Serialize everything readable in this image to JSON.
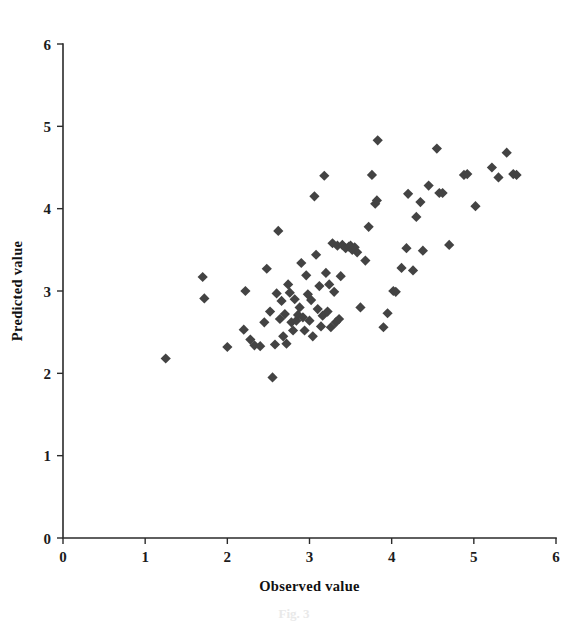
{
  "figure": {
    "background_color": "#ffffff",
    "marker_color": "#434343",
    "axis_color": "#2b2b2b",
    "caption_partial": "Fig. 3"
  },
  "chart_data": {
    "type": "scatter",
    "title": "",
    "xlabel": "Observed value",
    "ylabel": "Predicted value",
    "xlim": [
      0,
      6
    ],
    "ylim": [
      0,
      6
    ],
    "xticks": [
      "0",
      "1",
      "2",
      "3",
      "4",
      "5",
      "6"
    ],
    "yticks": [
      "0",
      "1",
      "2",
      "3",
      "4",
      "5",
      "6"
    ],
    "xtick_values": [
      0,
      1,
      2,
      3,
      4,
      5,
      6
    ],
    "ytick_values": [
      0,
      1,
      2,
      3,
      4,
      5,
      6
    ],
    "grid": false,
    "legend": null,
    "marker": "diamond",
    "marker_size": 9,
    "series": [
      {
        "name": "Observed vs Predicted",
        "color": "#434343",
        "points": [
          [
            1.25,
            2.18
          ],
          [
            1.7,
            3.17
          ],
          [
            1.72,
            2.91
          ],
          [
            2.0,
            2.32
          ],
          [
            2.2,
            2.53
          ],
          [
            2.22,
            3.0
          ],
          [
            2.28,
            2.41
          ],
          [
            2.33,
            2.34
          ],
          [
            2.4,
            2.33
          ],
          [
            2.45,
            2.62
          ],
          [
            2.48,
            3.27
          ],
          [
            2.52,
            2.75
          ],
          [
            2.55,
            1.95
          ],
          [
            2.58,
            2.35
          ],
          [
            2.6,
            2.97
          ],
          [
            2.62,
            3.73
          ],
          [
            2.64,
            2.66
          ],
          [
            2.66,
            2.88
          ],
          [
            2.68,
            2.45
          ],
          [
            2.7,
            2.72
          ],
          [
            2.72,
            2.36
          ],
          [
            2.74,
            3.08
          ],
          [
            2.76,
            2.98
          ],
          [
            2.78,
            2.62
          ],
          [
            2.8,
            2.52
          ],
          [
            2.82,
            2.9
          ],
          [
            2.84,
            2.64
          ],
          [
            2.86,
            2.71
          ],
          [
            2.88,
            2.8
          ],
          [
            2.9,
            3.34
          ],
          [
            2.92,
            2.68
          ],
          [
            2.94,
            2.52
          ],
          [
            2.96,
            3.19
          ],
          [
            2.98,
            2.96
          ],
          [
            3.0,
            2.64
          ],
          [
            3.02,
            2.89
          ],
          [
            3.04,
            2.45
          ],
          [
            3.06,
            4.15
          ],
          [
            3.08,
            3.44
          ],
          [
            3.1,
            2.78
          ],
          [
            3.12,
            3.06
          ],
          [
            3.14,
            2.57
          ],
          [
            3.16,
            2.7
          ],
          [
            3.18,
            4.4
          ],
          [
            3.2,
            3.22
          ],
          [
            3.22,
            2.75
          ],
          [
            3.24,
            3.08
          ],
          [
            3.26,
            2.56
          ],
          [
            3.28,
            3.58
          ],
          [
            3.3,
            2.99
          ],
          [
            3.32,
            2.62
          ],
          [
            3.34,
            3.55
          ],
          [
            3.36,
            2.66
          ],
          [
            3.38,
            3.18
          ],
          [
            3.4,
            3.56
          ],
          [
            3.44,
            3.52
          ],
          [
            3.48,
            3.54
          ],
          [
            3.5,
            3.55
          ],
          [
            3.52,
            3.5
          ],
          [
            3.55,
            3.53
          ],
          [
            3.58,
            3.47
          ],
          [
            3.62,
            2.8
          ],
          [
            3.68,
            3.37
          ],
          [
            3.72,
            3.78
          ],
          [
            3.76,
            4.41
          ],
          [
            3.8,
            4.06
          ],
          [
            3.82,
            4.1
          ],
          [
            3.83,
            4.83
          ],
          [
            3.9,
            2.56
          ],
          [
            3.95,
            2.73
          ],
          [
            4.02,
            3.0
          ],
          [
            4.05,
            2.99
          ],
          [
            4.12,
            3.28
          ],
          [
            4.18,
            3.52
          ],
          [
            4.2,
            4.18
          ],
          [
            4.26,
            3.25
          ],
          [
            4.3,
            3.9
          ],
          [
            4.35,
            4.08
          ],
          [
            4.38,
            3.49
          ],
          [
            4.45,
            4.28
          ],
          [
            4.55,
            4.73
          ],
          [
            4.58,
            4.19
          ],
          [
            4.62,
            4.19
          ],
          [
            4.7,
            3.56
          ],
          [
            4.88,
            4.41
          ],
          [
            4.92,
            4.42
          ],
          [
            5.02,
            4.03
          ],
          [
            5.22,
            4.5
          ],
          [
            5.3,
            4.38
          ],
          [
            5.4,
            4.68
          ],
          [
            5.48,
            4.42
          ],
          [
            5.52,
            4.41
          ]
        ]
      }
    ]
  }
}
